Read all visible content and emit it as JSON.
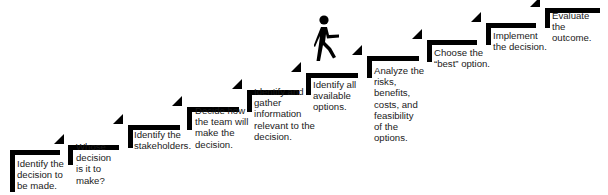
{
  "diagram": {
    "type": "staircase-process",
    "colors": {
      "bars": "#000000",
      "text": "#1a1a1a",
      "background": "#ffffff"
    },
    "figure": "walking-person-icon",
    "steps": [
      {
        "n": 1,
        "label": "Identify the\ndecision to\nbe made."
      },
      {
        "n": 2,
        "label": "Whose\ndecision\nis it to\nmake?"
      },
      {
        "n": 3,
        "label": "Identify the\nstakeholders."
      },
      {
        "n": 4,
        "label": "Decide how\nthe team will\nmake the\ndecision."
      },
      {
        "n": 5,
        "label": "Identify and\ngather\ninformation\nrelevant to the\ndecision."
      },
      {
        "n": 6,
        "label": "Identify all\navailable\noptions."
      },
      {
        "n": 7,
        "label": "Analyze the\nrisks,\nbenefits,\ncosts, and\nfeasibility\nof the\noptions."
      },
      {
        "n": 8,
        "label": "Choose the\n“best” option."
      },
      {
        "n": 9,
        "label": "Implement\nthe decision."
      },
      {
        "n": 10,
        "label": "Evaluate\nthe\noutcome."
      }
    ]
  }
}
